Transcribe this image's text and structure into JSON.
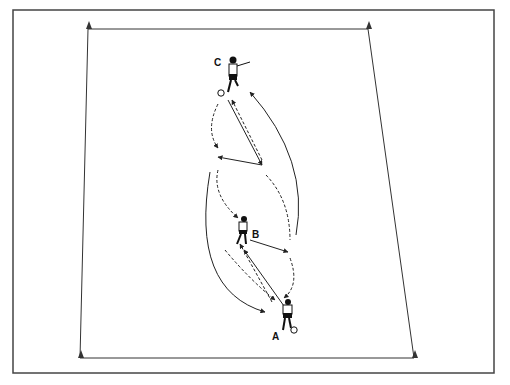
{
  "diagram": {
    "players": [
      {
        "label": "A",
        "x": 285,
        "y": 320,
        "has_ball": true
      },
      {
        "label": "B",
        "x": 240,
        "y": 230,
        "has_ball": false
      },
      {
        "label": "C",
        "x": 230,
        "y": 70,
        "has_ball": true
      }
    ],
    "field": {
      "corners": [
        [
          88,
          29
        ],
        [
          368,
          29
        ],
        [
          414,
          358
        ],
        [
          80,
          358
        ]
      ]
    },
    "colors": {
      "line": "#222222",
      "frame": "#444444",
      "background": "#ffffff"
    }
  },
  "labels": {
    "a": "A",
    "b": "B",
    "c": "C"
  }
}
